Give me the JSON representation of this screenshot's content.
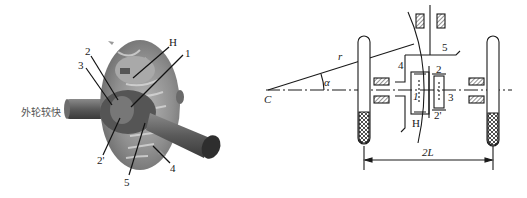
{
  "figure": {
    "left": {
      "description": "3D rendering of a bevel-gear differential",
      "side_label": "外轮较快",
      "part_labels": {
        "H": "H",
        "p1": "1",
        "p2": "2",
        "p3": "3",
        "p2prime": "2'",
        "p4": "4",
        "p5": "5"
      }
    },
    "right": {
      "description": "Kinematic schematic of differential on axle turning about point C",
      "labels": {
        "C": "C",
        "r": "r",
        "alpha": "α",
        "p1": "1",
        "p2": "2",
        "p2prime": "2'",
        "p3": "3",
        "p4": "4",
        "p5": "5",
        "H": "H",
        "track": "2L"
      }
    }
  }
}
